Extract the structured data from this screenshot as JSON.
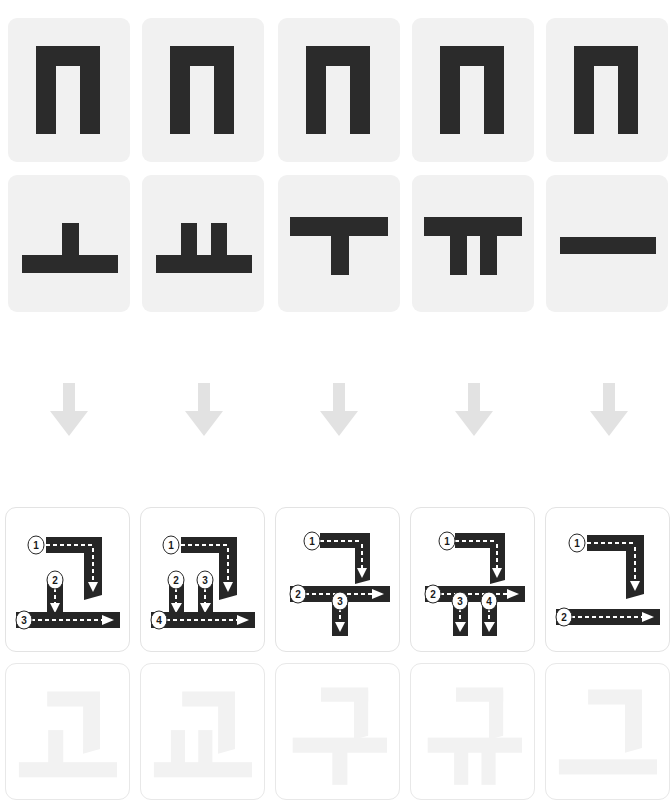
{
  "page": {
    "width": 670,
    "height": 806,
    "background": "#ffffff"
  },
  "colors": {
    "tile_background": "#f1f1f1",
    "glyph_black": "#2b2b2b",
    "stroke_path": "#262626",
    "dash_white": "#ffffff",
    "badge_fill": "#ffffff",
    "badge_text": "#1a1a1a",
    "arrow_gray": "#e2e2e2",
    "trace_gray": "#f2f2f2",
    "card_border": "#e3e3e3"
  },
  "consonant_row": {
    "label": "Initial consonant tiles",
    "tiles": [
      {
        "jamo": "ㄱ",
        "romanization": "g",
        "name": "giyeok"
      },
      {
        "jamo": "ㄱ",
        "romanization": "g",
        "name": "giyeok"
      },
      {
        "jamo": "ㄱ",
        "romanization": "g",
        "name": "giyeok"
      },
      {
        "jamo": "ㄱ",
        "romanization": "g",
        "name": "giyeok"
      },
      {
        "jamo": "ㄱ",
        "romanization": "g",
        "name": "giyeok"
      }
    ]
  },
  "vowel_row": {
    "label": "Vowel tiles",
    "tiles": [
      {
        "jamo": "ㅗ",
        "romanization": "o",
        "name": "o"
      },
      {
        "jamo": "ㅛ",
        "romanization": "yo",
        "name": "yo"
      },
      {
        "jamo": "ㅜ",
        "romanization": "u",
        "name": "u"
      },
      {
        "jamo": "ㅠ",
        "romanization": "yu",
        "name": "yu"
      },
      {
        "jamo": "ㅡ",
        "romanization": "eu",
        "name": "eu"
      }
    ]
  },
  "arrow_row": {
    "label": "Combine downward arrows",
    "icon": "arrow-down-icon",
    "count": 5
  },
  "stroke_cards": [
    {
      "syllable": "고",
      "romanization": "go",
      "stroke_count": 3,
      "stroke_numbers": [
        "1",
        "2",
        "3"
      ]
    },
    {
      "syllable": "교",
      "romanization": "gyo",
      "stroke_count": 4,
      "stroke_numbers": [
        "1",
        "2",
        "3",
        "4"
      ]
    },
    {
      "syllable": "구",
      "romanization": "gu",
      "stroke_count": 3,
      "stroke_numbers": [
        "1",
        "2",
        "3"
      ]
    },
    {
      "syllable": "규",
      "romanization": "gyu",
      "stroke_count": 4,
      "stroke_numbers": [
        "1",
        "2",
        "3",
        "4"
      ]
    },
    {
      "syllable": "그",
      "romanization": "geu",
      "stroke_count": 2,
      "stroke_numbers": [
        "1",
        "2"
      ]
    }
  ],
  "trace_cards": [
    {
      "syllable": "고",
      "romanization": "go"
    },
    {
      "syllable": "교",
      "romanization": "gyo"
    },
    {
      "syllable": "구",
      "romanization": "gu"
    },
    {
      "syllable": "규",
      "romanization": "gyu"
    },
    {
      "syllable": "그",
      "romanization": "geu"
    }
  ]
}
